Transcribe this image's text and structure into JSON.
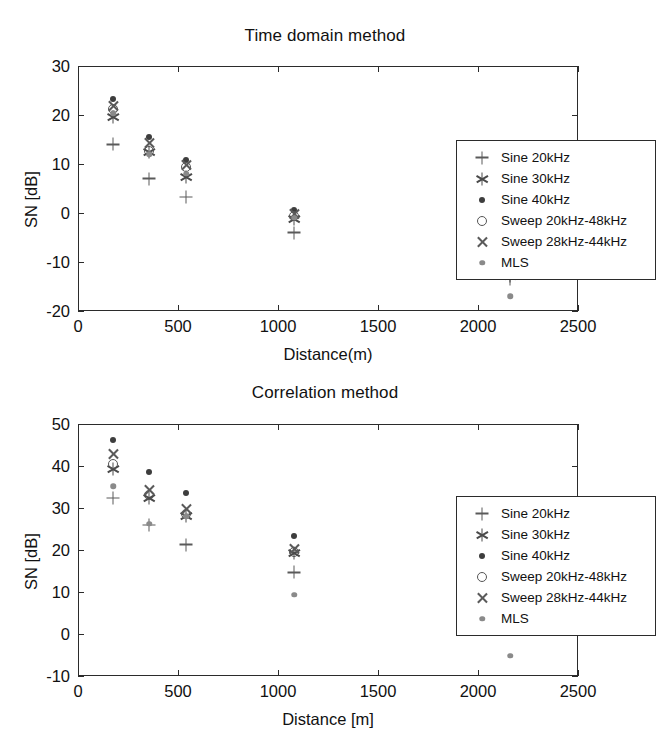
{
  "chart_data": [
    {
      "type": "scatter",
      "title": "Time domain method",
      "xlabel": "Distance(m)",
      "ylabel": "SN [dB]",
      "xlim": [
        0,
        2500
      ],
      "ylim": [
        -20,
        30
      ],
      "xticks": [
        0,
        500,
        1000,
        1500,
        2000,
        2500
      ],
      "yticks": [
        -20,
        -10,
        0,
        10,
        20,
        30
      ],
      "grid": false,
      "legend_position": "upper right",
      "x": [
        175,
        355,
        540,
        1080,
        2160
      ],
      "series": [
        {
          "name": "Sine 20kHz",
          "marker": "plus",
          "values": [
            14.0,
            7.0,
            3.3,
            -4.0,
            -13.5
          ]
        },
        {
          "name": "Sine 30kHz",
          "marker": "star",
          "values": [
            19.6,
            12.4,
            7.3,
            -1.3,
            -12.8
          ]
        },
        {
          "name": "Sine 40kHz",
          "marker": "dot",
          "values": [
            23.2,
            15.5,
            10.8,
            0.6,
            -11.8
          ]
        },
        {
          "name": "Sweep 20kHz-48kHz",
          "marker": "circle",
          "values": [
            21.2,
            12.7,
            9.3,
            -0.7,
            -12.2
          ]
        },
        {
          "name": "Sweep 28kHz-44kHz",
          "marker": "cross",
          "values": [
            21.8,
            14.3,
            9.7,
            -0.2,
            -12.0
          ]
        },
        {
          "name": "MLS",
          "marker": "mls",
          "values": [
            20.4,
            12.0,
            8.0,
            -1.0,
            -17.0
          ]
        }
      ]
    },
    {
      "type": "scatter",
      "title": "Correlation method",
      "xlabel": "Distance [m]",
      "ylabel": "SN [dB]",
      "xlim": [
        0,
        2500
      ],
      "ylim": [
        -10,
        50
      ],
      "xticks": [
        0,
        500,
        1000,
        1500,
        2000,
        2500
      ],
      "yticks": [
        -10,
        0,
        10,
        20,
        30,
        40,
        50
      ],
      "grid": false,
      "legend_position": "upper right",
      "x": [
        175,
        355,
        540,
        1080,
        2160
      ],
      "series": [
        {
          "name": "Sine 20kHz",
          "marker": "plus",
          "values": [
            32.4,
            26.0,
            21.3,
            14.7,
            6.6
          ]
        },
        {
          "name": "Sine 30kHz",
          "marker": "star",
          "values": [
            39.3,
            32.3,
            28.2,
            19.2,
            7.6
          ]
        },
        {
          "name": "Sine 40kHz",
          "marker": "dot",
          "values": [
            46.2,
            38.6,
            33.5,
            23.4,
            8.8
          ]
        },
        {
          "name": "Sweep 20kHz-48kHz",
          "marker": "circle",
          "values": [
            40.5,
            33.2,
            28.6,
            19.6,
            7.2
          ]
        },
        {
          "name": "Sweep 28kHz-44kHz",
          "marker": "cross",
          "values": [
            42.8,
            34.4,
            29.8,
            20.2,
            7.9
          ]
        },
        {
          "name": "MLS",
          "marker": "mls",
          "values": [
            35.2,
            26.2,
            28.0,
            9.3,
            -5.2
          ]
        }
      ]
    }
  ],
  "figures": [
    {
      "id": "top",
      "title": "Time domain method",
      "xlabel": "Distance(m)",
      "ylabel": "SN [dB]",
      "xtick_labels": [
        "0",
        "500",
        "1000",
        "1500",
        "2000",
        "2500"
      ],
      "ytick_labels": [
        "30",
        "20",
        "10",
        "0",
        "-10",
        "-20"
      ],
      "legend": [
        {
          "label": "Sine 20kHz",
          "marker": "plus-marker"
        },
        {
          "label": "Sine 30kHz",
          "marker": "star-marker"
        },
        {
          "label": "Sine 40kHz",
          "marker": "dot-marker"
        },
        {
          "label": "Sweep 20kHz-48kHz",
          "marker": "circle-marker"
        },
        {
          "label": "Sweep 28kHz-44kHz",
          "marker": "cross-marker"
        },
        {
          "label": "MLS",
          "marker": "mls-dot-marker"
        }
      ]
    },
    {
      "id": "bottom",
      "title": "Correlation method",
      "xlabel": "Distance [m]",
      "ylabel": "SN [dB]",
      "xtick_labels": [
        "0",
        "500",
        "1000",
        "1500",
        "2000",
        "2500"
      ],
      "ytick_labels": [
        "50",
        "40",
        "30",
        "20",
        "10",
        "0",
        "-10"
      ],
      "legend": [
        {
          "label": "Sine 20kHz",
          "marker": "plus-marker"
        },
        {
          "label": "Sine 30kHz",
          "marker": "star-marker"
        },
        {
          "label": "Sine 40kHz",
          "marker": "dot-marker"
        },
        {
          "label": "Sweep 20kHz-48kHz",
          "marker": "circle-marker"
        },
        {
          "label": "Sweep 28kHz-44kHz",
          "marker": "cross-marker"
        },
        {
          "label": "MLS",
          "marker": "mls-dot-marker"
        }
      ]
    }
  ],
  "colors": {
    "axis": "#2b2b2b",
    "text": "#111111",
    "marker_dark": "#3d3d3d",
    "marker_mid": "#5a5a5a",
    "marker_light": "#8a8a8a",
    "background": "#ffffff"
  }
}
